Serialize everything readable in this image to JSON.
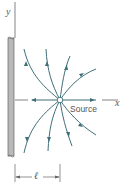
{
  "diagram": {
    "type": "flow-field",
    "labels": {
      "y_axis": "y",
      "x_axis": "x",
      "source": "Source",
      "distance": "ℓ"
    },
    "colors": {
      "streamline": "#3f6f78",
      "wall_fill": "#b9b9b9",
      "wall_edge": "#666666",
      "axis": "#666666",
      "text": "#555555"
    },
    "geometry": {
      "source_center": [
        60,
        100
      ],
      "wall_x": [
        7,
        14
      ],
      "wall_y": [
        37,
        157
      ],
      "dimension_y": 177
    }
  }
}
